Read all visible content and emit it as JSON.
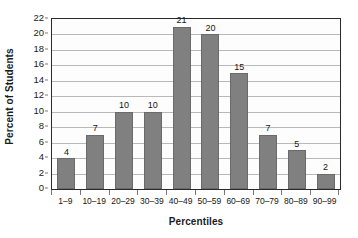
{
  "chart_data": {
    "type": "bar",
    "title": "",
    "subtitle": "",
    "xlabel": "Percentiles",
    "ylabel": "Percent of Students",
    "categories": [
      "1–9",
      "10–19",
      "20–29",
      "30–39",
      "40–49",
      "50–59",
      "60–69",
      "70–79",
      "80–89",
      "90–99"
    ],
    "values": [
      4,
      7,
      10,
      10,
      21,
      20,
      15,
      7,
      5,
      2
    ],
    "data_labels": [
      "4",
      "7",
      "10",
      "10",
      "21",
      "20",
      "15",
      "7",
      "5",
      "2"
    ],
    "ylim": [
      0,
      22
    ],
    "ytick_step": 2,
    "ytick_labels": [
      "0",
      "2",
      "4",
      "6",
      "8",
      "10",
      "12",
      "14",
      "16",
      "18",
      "20",
      "22"
    ],
    "grid": "horizontal",
    "legend": "none",
    "bar_color": "#808080",
    "bar_border_color": "#6a6a6a",
    "gridline_color": "#b9b9b9",
    "plot_border_color": "#2a2a2a",
    "plot_background": "#fdfdfd",
    "text_color": "#161616"
  }
}
